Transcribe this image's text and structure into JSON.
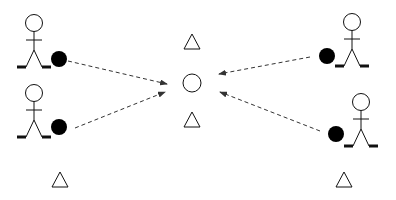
{
  "diagram": {
    "colors": {
      "stroke": "#111111",
      "ball": "#000000",
      "arrow": "#333333",
      "background": "#ffffff"
    },
    "players": [
      {
        "id": "player-top-left",
        "head": [
          34,
          23
        ],
        "ball": [
          59,
          59
        ],
        "facing": "right"
      },
      {
        "id": "player-bottom-left",
        "head": [
          34,
          93
        ],
        "ball": [
          59,
          127
        ],
        "facing": "right"
      },
      {
        "id": "player-top-right",
        "head": [
          352,
          22
        ],
        "ball": [
          327,
          56
        ],
        "facing": "left"
      },
      {
        "id": "player-bottom-right",
        "head": [
          361,
          102
        ],
        "ball": [
          336,
          134
        ],
        "facing": "left"
      }
    ],
    "target_circle": {
      "center": [
        192,
        83
      ],
      "r": 9
    },
    "cones": [
      {
        "id": "cone-top-center",
        "center": [
          192,
          42
        ]
      },
      {
        "id": "cone-bottom-center",
        "center": [
          192,
          120
        ]
      },
      {
        "id": "cone-bottom-left",
        "center": [
          60,
          180
        ]
      },
      {
        "id": "cone-bottom-right",
        "center": [
          344,
          180
        ]
      }
    ],
    "arrows": [
      {
        "id": "arrow-top-left",
        "from": [
          68,
          61
        ],
        "to": [
          167,
          84
        ]
      },
      {
        "id": "arrow-bottom-left",
        "from": [
          75,
          128
        ],
        "to": [
          165,
          92
        ]
      },
      {
        "id": "arrow-top-right",
        "from": [
          310,
          57
        ],
        "to": [
          219,
          74
        ]
      },
      {
        "id": "arrow-bottom-right",
        "from": [
          320,
          131
        ],
        "to": [
          220,
          92
        ]
      }
    ]
  }
}
